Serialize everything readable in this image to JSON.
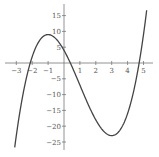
{
  "chart_data": {
    "type": "line",
    "title": "",
    "xlabel": "",
    "ylabel": "",
    "function": "x^3 - 3x^2 - 9x + 4",
    "xlim": [
      -3.3,
      5.6
    ],
    "ylim": [
      -27,
      17
    ],
    "grid": false,
    "legend": null,
    "x_ticks": [
      -3,
      -2,
      -1,
      1,
      2,
      3,
      4,
      5
    ],
    "x_tick_labels": [
      "−3",
      "−2",
      "−1",
      "1",
      "2",
      "3",
      "4",
      "5"
    ],
    "y_ticks": [
      15,
      10,
      5,
      -5,
      -10,
      -15,
      -20,
      -25
    ],
    "y_tick_labels": [
      "15",
      "10",
      "5",
      "−5",
      "−10",
      "−15",
      "−20",
      "−25"
    ],
    "key_points": {
      "local_max": {
        "x": -1,
        "y": 9
      },
      "local_min": {
        "x": 3,
        "y": -23
      },
      "y_intercept": {
        "x": 0,
        "y": 4
      },
      "roots_approx": [
        -1.8,
        0.4,
        4.7
      ]
    },
    "series": [
      {
        "name": "f(x)",
        "x": [
          -3.1,
          -3.0,
          -2.5,
          -2.0,
          -1.5,
          -1.0,
          -0.5,
          0.0,
          0.5,
          1.0,
          1.5,
          2.0,
          2.5,
          3.0,
          3.5,
          4.0,
          4.5,
          5.0,
          5.2
        ],
        "values": [
          -26.7,
          -23,
          -7.4,
          2,
          7.6,
          9,
          7.4,
          4,
          -1.4,
          -7,
          -12.6,
          -18,
          -21.6,
          -23,
          -21.4,
          -16,
          -6.1,
          9,
          16.5
        ]
      }
    ],
    "colors": {
      "curve": "#444444",
      "axis": "#777777",
      "label": "#555555"
    }
  }
}
